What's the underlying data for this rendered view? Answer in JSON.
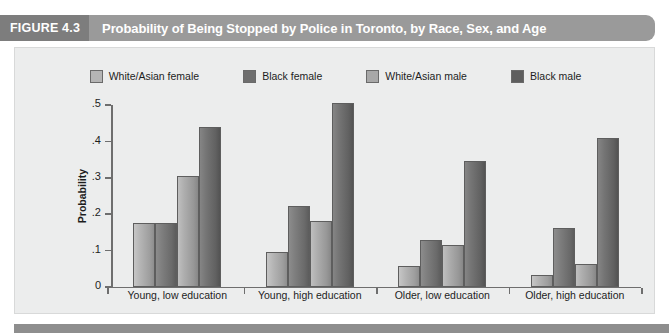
{
  "figure": {
    "number_label": "FIGURE 4.3",
    "title": "Probability of Being Stopped by Police in Toronto, by Race, Sex, and Age"
  },
  "chart_data": {
    "type": "bar",
    "title": "Probability of Being Stopped by Police in Toronto, by Race, Sex, and Age",
    "xlabel": "",
    "ylabel": "Probability",
    "ylim": [
      0,
      0.5
    ],
    "ytick_labels": [
      "0",
      ".1",
      ".2",
      ".3",
      ".4",
      ".5"
    ],
    "ytick_values": [
      0,
      0.1,
      0.2,
      0.3,
      0.4,
      0.5
    ],
    "grid": false,
    "legend_position": "top-center",
    "categories": [
      "Young, low education",
      "Young, high education",
      "Older, low education",
      "Older, high education"
    ],
    "series": [
      {
        "name": "White/Asian female",
        "color": "#b5b5b5",
        "values": [
          0.175,
          0.095,
          0.057,
          0.032
        ]
      },
      {
        "name": "Black female",
        "color": "#6e6e6e",
        "values": [
          0.175,
          0.222,
          0.13,
          0.162
        ]
      },
      {
        "name": "White/Asian male",
        "color": "#a8a8a8",
        "values": [
          0.305,
          0.18,
          0.115,
          0.062
        ]
      },
      {
        "name": "Black male",
        "color": "#5e5e5e",
        "values": [
          0.44,
          0.505,
          0.345,
          0.41
        ]
      }
    ]
  },
  "colors": {
    "header_band": "#9a9a9a",
    "header_number_block": "#7d7d7d",
    "panel_background": "#eceded",
    "axis": "#6e6e6e",
    "bottom_rule": "#8e8e8e"
  }
}
